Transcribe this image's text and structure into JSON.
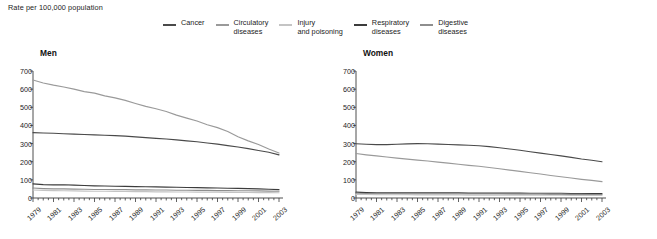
{
  "axis_unit_label": "Rate per 100,000 population",
  "legend": {
    "entries": [
      {
        "label": "Cancer",
        "color": "#4a4a4a"
      },
      {
        "label": "Circulatory\ndiseases",
        "color": "#9a9a9a"
      },
      {
        "label": "Injury\nand poisoning",
        "color": "#c4c4c4"
      },
      {
        "label": "Respiratory\ndiseases",
        "color": "#3c3c3c"
      },
      {
        "label": "Digestive\ndiseases",
        "color": "#8e8e8e"
      }
    ]
  },
  "panels": [
    {
      "title": "Men"
    },
    {
      "title": "Women"
    }
  ],
  "chart_data": [
    {
      "type": "line",
      "title": "Men",
      "xlabel": "",
      "ylabel": "Rate per 100,000 population",
      "ylim": [
        0,
        700
      ],
      "yticks": [
        0,
        100,
        200,
        300,
        400,
        500,
        600,
        700
      ],
      "grid": false,
      "legend_position": "top",
      "x": [
        1979,
        1980,
        1981,
        1982,
        1983,
        1984,
        1985,
        1986,
        1987,
        1988,
        1989,
        1990,
        1991,
        1992,
        1993,
        1994,
        1995,
        1996,
        1997,
        1998,
        1999,
        2000,
        2001,
        2002,
        2003
      ],
      "xticks": [
        1979,
        1981,
        1983,
        1985,
        1987,
        1989,
        1991,
        1993,
        1995,
        1997,
        1999,
        2001,
        2003
      ],
      "series": [
        {
          "name": "Circulatory diseases",
          "color": "#9a9a9a",
          "values": [
            650,
            634,
            622,
            612,
            600,
            586,
            578,
            563,
            552,
            538,
            521,
            505,
            492,
            477,
            457,
            440,
            424,
            404,
            388,
            367,
            338,
            315,
            295,
            270,
            248
          ]
        },
        {
          "name": "Cancer",
          "color": "#4a4a4a",
          "values": [
            360,
            358,
            357,
            354,
            352,
            350,
            348,
            346,
            344,
            341,
            337,
            333,
            329,
            325,
            320,
            315,
            310,
            303,
            297,
            289,
            281,
            272,
            262,
            252,
            238
          ]
        },
        {
          "name": "Respiratory diseases",
          "color": "#3c3c3c",
          "values": [
            78,
            74,
            72,
            73,
            71,
            69,
            67,
            66,
            65,
            64,
            63,
            62,
            61,
            60,
            59,
            58,
            57,
            56,
            55,
            54,
            53,
            52,
            50,
            48,
            46
          ]
        },
        {
          "name": "Digestive diseases",
          "color": "#8e8e8e",
          "values": [
            55,
            52,
            50,
            50,
            49,
            48,
            47,
            47,
            46,
            46,
            45,
            45,
            44,
            44,
            43,
            43,
            42,
            42,
            41,
            41,
            40,
            40,
            39,
            38,
            37
          ]
        },
        {
          "name": "Injury and poisoning",
          "color": "#c4c4c4",
          "values": [
            44,
            42,
            41,
            40,
            39,
            38,
            37,
            37,
            36,
            36,
            35,
            35,
            34,
            34,
            33,
            33,
            32,
            32,
            32,
            31,
            31,
            31,
            30,
            30,
            29
          ]
        }
      ]
    },
    {
      "type": "line",
      "title": "Women",
      "xlabel": "",
      "ylabel": "Rate per 100,000 population",
      "ylim": [
        0,
        700
      ],
      "yticks": [
        0,
        100,
        200,
        300,
        400,
        500,
        600,
        700
      ],
      "grid": false,
      "legend_position": "top",
      "x": [
        1979,
        1980,
        1981,
        1982,
        1983,
        1984,
        1985,
        1986,
        1987,
        1988,
        1989,
        1990,
        1991,
        1992,
        1993,
        1994,
        1995,
        1996,
        1997,
        1998,
        1999,
        2000,
        2001,
        2002,
        2003
      ],
      "xticks": [
        1979,
        1981,
        1983,
        1985,
        1987,
        1989,
        1991,
        1993,
        1995,
        1997,
        1999,
        2001,
        2003
      ],
      "series": [
        {
          "name": "Cancer",
          "color": "#4a4a4a",
          "values": [
            299,
            296,
            294,
            294,
            296,
            298,
            300,
            299,
            297,
            295,
            293,
            291,
            288,
            283,
            277,
            270,
            263,
            255,
            247,
            240,
            232,
            224,
            215,
            208,
            200
          ]
        },
        {
          "name": "Circulatory diseases",
          "color": "#9a9a9a",
          "values": [
            245,
            238,
            232,
            226,
            220,
            214,
            209,
            204,
            198,
            192,
            186,
            180,
            175,
            168,
            161,
            154,
            147,
            139,
            132,
            124,
            117,
            110,
            103,
            97,
            90
          ]
        },
        {
          "name": "Respiratory diseases",
          "color": "#3c3c3c",
          "values": [
            32,
            30,
            29,
            29,
            28,
            28,
            28,
            28,
            29,
            28,
            28,
            27,
            27,
            27,
            27,
            27,
            27,
            26,
            26,
            26,
            26,
            25,
            25,
            24,
            24
          ]
        },
        {
          "name": "Digestive diseases",
          "color": "#8e8e8e",
          "values": [
            26,
            25,
            24,
            24,
            24,
            23,
            23,
            23,
            23,
            23,
            22,
            22,
            22,
            22,
            22,
            21,
            21,
            21,
            21,
            20,
            20,
            20,
            20,
            19,
            19
          ]
        },
        {
          "name": "Injury and poisoning",
          "color": "#c4c4c4",
          "values": [
            20,
            19,
            19,
            18,
            18,
            18,
            17,
            17,
            17,
            17,
            17,
            16,
            16,
            16,
            16,
            16,
            15,
            15,
            15,
            15,
            15,
            14,
            14,
            14,
            14
          ]
        }
      ]
    }
  ]
}
